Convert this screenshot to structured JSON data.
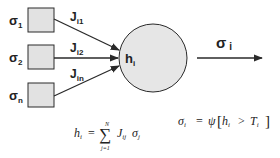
{
  "diagram": {
    "colors": {
      "stroke": "#2a2a2a",
      "box_fill": "#e2e2e2",
      "neuron_fill": "#e6e6e6",
      "text": "#222222"
    },
    "inputs": [
      {
        "sigma": "σ",
        "sub": "1",
        "weight": "J",
        "weight_sub": "i1"
      },
      {
        "sigma": "σ",
        "sub": "2",
        "weight": "J",
        "weight_sub": "i2"
      },
      {
        "sigma": "σ",
        "sub": "n",
        "weight": "J",
        "weight_sub": "in"
      }
    ],
    "neuron": {
      "label": "h",
      "label_sub": "i"
    },
    "output": {
      "label": "σ",
      "label_sub": "i"
    },
    "equations": {
      "sum": {
        "lhs": "h",
        "lhs_sub": "i",
        "eq": "=",
        "sum_symbol": "∑",
        "upper": "N",
        "lower": "j=1",
        "term_J": "J",
        "term_J_sub": "ij",
        "term_sigma": "σ",
        "term_sigma_sub": "j"
      },
      "activation": {
        "lhs": "σ",
        "lhs_sub": "i",
        "eq": "=",
        "psi": "ψ",
        "open": "[",
        "h": "h",
        "h_sub": "i",
        "gt": ">",
        "T": "T",
        "T_sub": "i",
        "close": "]"
      }
    }
  }
}
